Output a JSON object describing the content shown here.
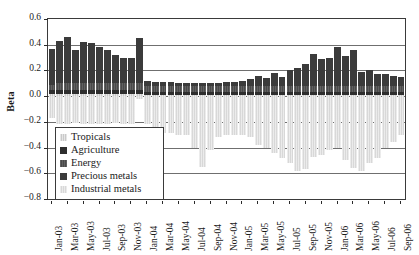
{
  "chart_data": {
    "type": "bar",
    "title": "",
    "xlabel": "",
    "ylabel": "Beta",
    "ylim": [
      -0.8,
      0.6
    ],
    "ytick_labels": [
      "0.6",
      "0.4",
      "0.2",
      "0.0",
      "-0.2",
      "-0.4",
      "-0.6",
      "-0.8"
    ],
    "ytick_values": [
      0.6,
      0.4,
      0.2,
      0.0,
      -0.2,
      -0.4,
      -0.6,
      -0.8
    ],
    "grid": true,
    "stacked": true,
    "legend_position": "inside-lower-left",
    "legend_entries": [
      "Tropicals",
      "Agriculture",
      "Energy",
      "Precious metals",
      "Industrial metals"
    ],
    "colors": {
      "Tropicals": "#c9c9c9",
      "Agriculture": "#2e2e2e",
      "Energy": "#4a4a4a",
      "Precious metals": "#3b3b3b",
      "Industrial metals": "#d8d8d8"
    },
    "categories": [
      "Jan-03",
      "Feb-03",
      "Mar-03",
      "Apr-03",
      "May-03",
      "Jun-03",
      "Jul-03",
      "Aug-03",
      "Sep-03",
      "Oct-03",
      "Nov-03",
      "Dec-03",
      "Jan-04",
      "Feb-04",
      "Mar-04",
      "Apr-04",
      "May-04",
      "Jun-04",
      "Jul-04",
      "Aug-04",
      "Sep-04",
      "Oct-04",
      "Nov-04",
      "Dec-04",
      "Jan-05",
      "Feb-05",
      "Mar-05",
      "Apr-05",
      "May-05",
      "Jun-05",
      "Jul-05",
      "Aug-05",
      "Sep-05",
      "Oct-05",
      "Nov-05",
      "Dec-05",
      "Jan-06",
      "Feb-06",
      "Mar-06",
      "Apr-06",
      "May-06",
      "Jun-06",
      "Jul-06",
      "Aug-06",
      "Sep-06"
    ],
    "xtick_labels": [
      "Jan-03",
      "Mar-03",
      "May-03",
      "Jul-03",
      "Sep-03",
      "Nov-03",
      "Jan-04",
      "Mar-04",
      "May-04",
      "Jul-04",
      "Sep-04",
      "Nov-04",
      "Jan-05",
      "Mar-05",
      "May-05",
      "Jul-05",
      "Sep-05",
      "Nov-05",
      "Jan-06",
      "Mar-06",
      "May-06",
      "Jul-06",
      "Sep-06"
    ],
    "series": [
      {
        "name": "Tropicals",
        "values": [
          0.02,
          0.02,
          0.02,
          0.02,
          0.02,
          0.02,
          0.02,
          0.02,
          0.02,
          0.02,
          0.02,
          0.02,
          0.01,
          0.01,
          0.01,
          0.01,
          0.01,
          0.01,
          0.01,
          0.01,
          0.01,
          0.01,
          0.01,
          0.01,
          0.01,
          0.01,
          0.01,
          0.01,
          0.01,
          0.01,
          0.01,
          0.01,
          0.01,
          0.01,
          0.01,
          0.01,
          0.01,
          0.01,
          0.01,
          0.01,
          0.01,
          0.01,
          0.01,
          0.01,
          0.01
        ]
      },
      {
        "name": "Agriculture",
        "values": [
          0.03,
          0.03,
          0.03,
          0.03,
          0.03,
          0.03,
          0.03,
          0.03,
          0.03,
          0.03,
          0.03,
          0.03,
          0.02,
          0.02,
          0.02,
          0.02,
          0.02,
          0.02,
          0.02,
          0.02,
          0.02,
          0.02,
          0.02,
          0.02,
          0.02,
          0.02,
          0.02,
          0.02,
          0.02,
          0.02,
          0.02,
          0.02,
          0.02,
          0.02,
          0.02,
          0.02,
          0.02,
          0.02,
          0.02,
          0.02,
          0.02,
          0.02,
          0.02,
          0.02,
          0.02
        ]
      },
      {
        "name": "Energy",
        "values": [
          0.04,
          0.05,
          0.05,
          0.05,
          0.05,
          0.05,
          0.05,
          0.05,
          0.05,
          0.05,
          0.05,
          0.05,
          0.05,
          0.05,
          0.05,
          0.05,
          0.05,
          0.05,
          0.05,
          0.05,
          0.05,
          0.05,
          0.05,
          0.05,
          0.05,
          0.05,
          0.05,
          0.05,
          0.05,
          0.05,
          0.05,
          0.05,
          0.05,
          0.05,
          0.05,
          0.05,
          0.05,
          0.05,
          0.05,
          0.05,
          0.05,
          0.05,
          0.05,
          0.05,
          0.05
        ]
      },
      {
        "name": "Precious metals",
        "values": [
          0.28,
          0.33,
          0.36,
          0.26,
          0.32,
          0.31,
          0.28,
          0.26,
          0.22,
          0.2,
          0.2,
          0.35,
          0.04,
          0.03,
          0.03,
          0.03,
          0.02,
          0.02,
          0.02,
          0.02,
          0.02,
          0.02,
          0.03,
          0.03,
          0.04,
          0.05,
          0.08,
          0.06,
          0.1,
          0.07,
          0.12,
          0.14,
          0.17,
          0.25,
          0.21,
          0.22,
          0.3,
          0.23,
          0.28,
          0.11,
          0.12,
          0.09,
          0.09,
          0.08,
          0.07
        ]
      },
      {
        "name": "Industrial metals",
        "values": [
          -0.17,
          -0.22,
          -0.22,
          -0.21,
          -0.22,
          -0.22,
          -0.22,
          -0.22,
          -0.21,
          -0.22,
          -0.22,
          -0.02,
          -0.22,
          -0.26,
          -0.29,
          -0.29,
          -0.3,
          -0.3,
          -0.4,
          -0.55,
          -0.42,
          -0.32,
          -0.3,
          -0.3,
          -0.3,
          -0.32,
          -0.38,
          -0.4,
          -0.44,
          -0.48,
          -0.52,
          -0.58,
          -0.57,
          -0.47,
          -0.46,
          -0.42,
          -0.4,
          -0.5,
          -0.56,
          -0.58,
          -0.52,
          -0.48,
          -0.4,
          -0.36,
          -0.3
        ]
      }
    ]
  }
}
